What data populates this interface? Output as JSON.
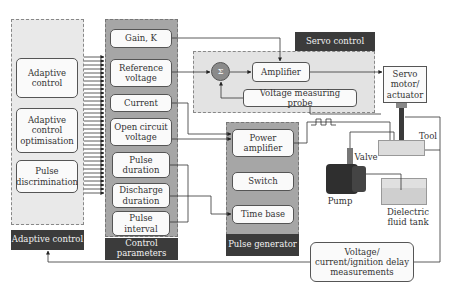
{
  "panels": {
    "adaptive_control": {
      "caption": "Adaptive control",
      "items": [
        "Adaptive control",
        "Adaptive control optimisation",
        "Pulse discrimination"
      ]
    },
    "control_parameters": {
      "caption": "Control parameters",
      "items": [
        "Gain, K",
        "Reference voltage",
        "Current",
        "Open circuit voltage",
        "Pulse duration",
        "Discharge duration",
        "Pulse interval"
      ]
    },
    "servo_control": {
      "caption": "Servo control",
      "summing_symbol": "Σ",
      "items": [
        "Amplifier",
        "Voltage measuring probe"
      ]
    },
    "pulse_generator": {
      "caption": "Pulse generator",
      "items": [
        "Power amplifier",
        "Switch",
        "Time base"
      ]
    }
  },
  "equipment": {
    "servo_motor": "Servo motor/ actuator",
    "tool": "Tool",
    "valve": "Valve",
    "pump": "Pump",
    "tank": "Dielectric fluid tank",
    "measurements": "Voltage/ current/ignition delay measurements"
  },
  "colors": {
    "caption_bg": "#3b3b3b",
    "panel_light": "#e9e9e9",
    "panel_dark": "#a6a6a6",
    "sum_node": "#8a8a8a"
  }
}
